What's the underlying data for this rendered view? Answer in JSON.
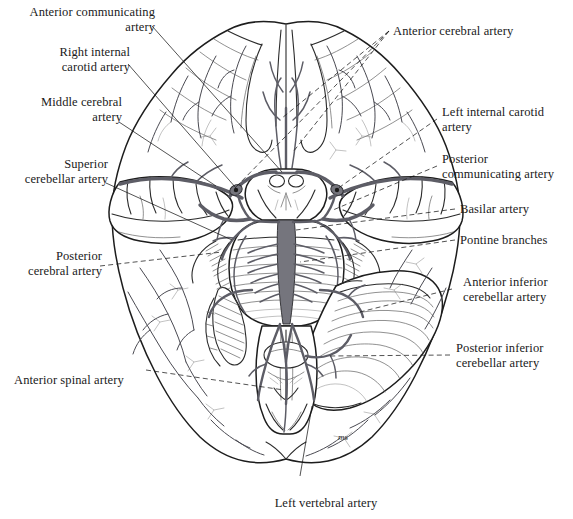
{
  "figure": {
    "background_color": "#ffffff",
    "ink_color": "#1a1a1a",
    "artery_color": "#6a6a70",
    "artist_signature": "ms"
  },
  "labels": {
    "anterior_communicating_artery": "Anterior communicating\nartery",
    "right_internal_carotid_artery": "Right internal\ncarotid artery",
    "middle_cerebral_artery": "Middle cerebral\nartery",
    "superior_cerebellar_artery": "Superior\ncerebellar artery",
    "posterior_cerebral_artery": "Posterior\ncerebral artery",
    "anterior_spinal_artery": "Anterior spinal artery",
    "anterior_cerebral_artery": "Anterior cerebral artery",
    "left_internal_carotid_artery": "Left internal carotid\nartery",
    "posterior_communicating_artery": "Posterior\ncommunicating artery",
    "basilar_artery": "Basilar artery",
    "pontine_branches": "Pontine branches",
    "anterior_inferior_cerebellar_artery": "Anterior inferior\ncerebellar artery",
    "posterior_inferior_cerebellar_artery": "Posterior inferior\ncerebellar artery",
    "left_vertebral_artery": "Left vertebral artery"
  }
}
